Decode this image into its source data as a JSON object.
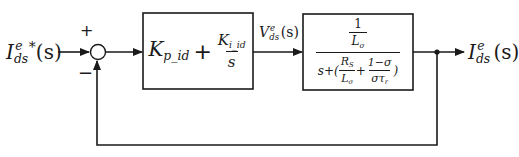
{
  "diagram": {
    "type": "closed-loop control block diagram",
    "input": {
      "symbol": "I",
      "superscript": "e",
      "subscript": "ds",
      "star": "*",
      "arg": "(s)"
    },
    "summing_junction": {
      "plus_sign": "+",
      "minus_sign": "−"
    },
    "controller_block": {
      "kp_symbol": "K",
      "kp_subscript": "p_id",
      "plus": "+",
      "ki_symbol": "K",
      "ki_subscript": "i_id",
      "ki_denominator": "s"
    },
    "intermediate_signal": {
      "symbol": "V",
      "superscript": "e",
      "subscript": "ds",
      "arg": "(s)"
    },
    "plant_block": {
      "numerator_one": "1",
      "numerator_L": "L",
      "numerator_L_sub": "σ",
      "den_s_plus": "s+(",
      "den_Rs": "R",
      "den_Rs_sub": "S",
      "den_L": "L",
      "den_L_sub": "σ",
      "den_plus": "+",
      "den_one_minus_sigma": "1−σ",
      "den_sigma_tau": "στ",
      "den_tau_sub": "r",
      "den_close": ")"
    },
    "output": {
      "symbol": "I",
      "superscript": "e",
      "subscript": "ds",
      "arg": "(s)"
    },
    "colors": {
      "line": "#1a1a1a",
      "background": "#ffffff"
    }
  }
}
